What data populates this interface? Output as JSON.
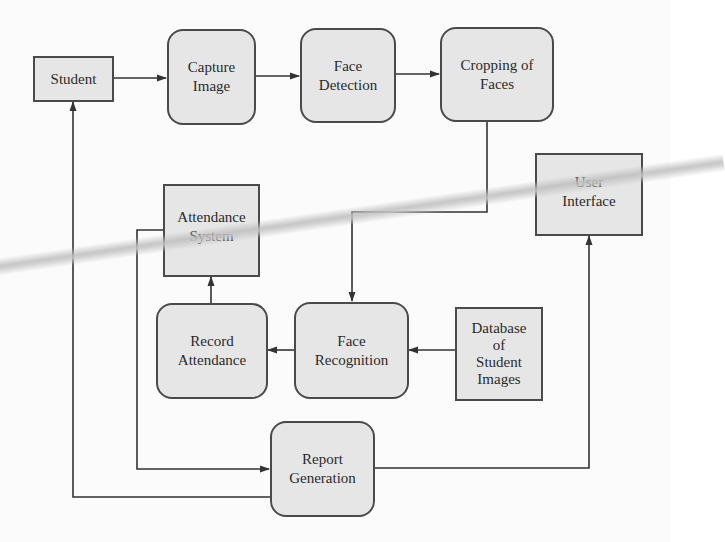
{
  "diagram": {
    "type": "flowchart",
    "colors": {
      "node_fill": "#e6e6e6",
      "node_border": "#4a4a4a",
      "edge": "#333333",
      "background": "#fbfbfb"
    },
    "nodes": {
      "student": {
        "label": "Student",
        "shape": "rectangle"
      },
      "capture_image": {
        "label": "Capture\nImage",
        "shape": "rounded"
      },
      "face_detection": {
        "label": "Face\nDetection",
        "shape": "rounded"
      },
      "cropping_of_faces": {
        "label": "Cropping of\nFaces",
        "shape": "rounded"
      },
      "user_interface": {
        "label": "User\nInterface",
        "shape": "rectangle"
      },
      "attendance_system": {
        "label": "Attendance\nSystem",
        "shape": "rectangle"
      },
      "record_attendance": {
        "label": "Record\nAttendance",
        "shape": "rounded"
      },
      "face_recognition": {
        "label": "Face\nRecognition",
        "shape": "rounded"
      },
      "database": {
        "label": "Database\nof\nStudent\nImages",
        "shape": "rectangle"
      },
      "report_generation": {
        "label": "Report\nGeneration",
        "shape": "rounded"
      }
    },
    "edges": [
      {
        "from": "Student",
        "to": "Capture Image"
      },
      {
        "from": "Capture Image",
        "to": "Face Detection"
      },
      {
        "from": "Face Detection",
        "to": "Cropping of Faces"
      },
      {
        "from": "Cropping of Faces",
        "to": "Face Recognition"
      },
      {
        "from": "Database of Student Images",
        "to": "Face Recognition"
      },
      {
        "from": "Face Recognition",
        "to": "Record Attendance"
      },
      {
        "from": "Record Attendance",
        "to": "Attendance System"
      },
      {
        "from": "Attendance System",
        "to": "Report Generation"
      },
      {
        "from": "Report Generation",
        "to": "User Interface"
      },
      {
        "from": "Report Generation",
        "to": "Student"
      }
    ]
  }
}
